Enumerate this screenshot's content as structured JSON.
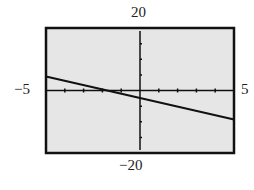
{
  "chart_data": {
    "type": "line",
    "title": "",
    "xlabel": "",
    "ylabel": "",
    "xlim": [
      -5,
      5
    ],
    "ylim": [
      -20,
      20
    ],
    "xticks_step": 1,
    "yticks_step": 5,
    "grid": false,
    "tick_labels": {
      "xmin": "−5",
      "xmax": "5",
      "ymax": "20",
      "ymin": "−20"
    },
    "series": [
      {
        "name": "line",
        "x": [
          -5,
          5
        ],
        "y": [
          4.5,
          -9.3
        ]
      }
    ],
    "colors": {
      "plot_background": "#e6e6e6",
      "line": "#111111",
      "frame": "#111111"
    }
  }
}
